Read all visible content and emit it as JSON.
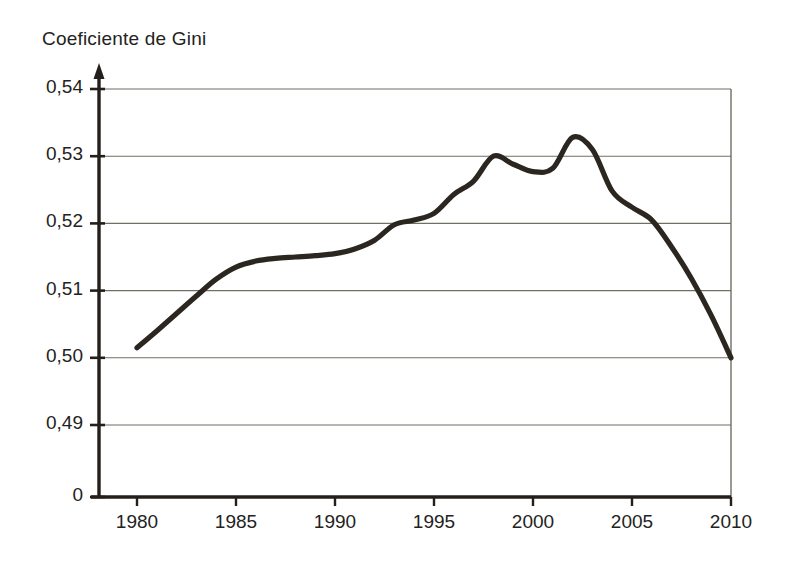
{
  "chart_data": {
    "type": "line",
    "title": "Coeficiente de Gini",
    "xlabel": "",
    "ylabel": "",
    "xlim": [
      1978,
      2010
    ],
    "ylim": [
      0.485,
      0.54
    ],
    "grid": true,
    "legend": null,
    "axis_break": true,
    "yticks": [
      "0",
      "0,49",
      "0,50",
      "0,51",
      "0,52",
      "0,53",
      "0,54"
    ],
    "ytick_values": [
      0,
      0.49,
      0.5,
      0.51,
      0.52,
      0.53,
      0.54
    ],
    "xticks": [
      "1980",
      "1985",
      "1990",
      "1995",
      "2000",
      "2005",
      "2010"
    ],
    "xtick_values": [
      1980,
      1985,
      1990,
      1995,
      2000,
      2005,
      2010
    ],
    "series": [
      {
        "name": "Coeficiente de Gini",
        "color": "#2b2620",
        "x": [
          1980,
          1981,
          1982,
          1983,
          1984,
          1985,
          1986,
          1987,
          1988,
          1989,
          1990,
          1991,
          1992,
          1993,
          1994,
          1995,
          1996,
          1997,
          1998,
          1999,
          2000,
          2001,
          2002,
          2003,
          2004,
          2005,
          2006,
          2007,
          2008,
          2009,
          2010
        ],
        "values": [
          0.5015,
          0.504,
          0.5066,
          0.5092,
          0.5117,
          0.5135,
          0.5144,
          0.5148,
          0.515,
          0.5152,
          0.5155,
          0.5162,
          0.5175,
          0.5198,
          0.5205,
          0.5215,
          0.5243,
          0.5263,
          0.53,
          0.5288,
          0.5277,
          0.5282,
          0.5328,
          0.531,
          0.5248,
          0.5224,
          0.5205,
          0.5165,
          0.5118,
          0.5063,
          0.5
        ]
      }
    ],
    "annotations": {
      "start_year": 1980,
      "start_value": 0.5015,
      "first_peak_year": 1998,
      "first_peak_value": 0.53,
      "dip_year": 2000,
      "dip_value": 0.5277,
      "max_year": 2002,
      "max_value": 0.5328,
      "end_year": 2010,
      "end_value": 0.5
    }
  },
  "geometry": {
    "plot_left": 99,
    "plot_right": 731,
    "plot_top": 89,
    "plot_bottom": 497,
    "data_x_start": 137,
    "data_x_end": 731
  },
  "colors": {
    "line": "#2b2620",
    "grid": "#6f6f64",
    "axis": "#241f1a",
    "background": "#ffffff",
    "text": "#23231c"
  }
}
